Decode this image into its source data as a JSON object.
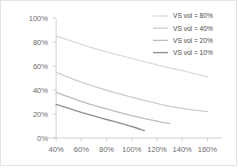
{
  "chart_data": {
    "type": "line",
    "title": "",
    "xlabel": "",
    "ylabel": "",
    "xlim": [
      30,
      170
    ],
    "ylim": [
      0,
      100
    ],
    "xticks": [
      "40%",
      "60%",
      "80%",
      "100%",
      "120%",
      "140%",
      "160%"
    ],
    "xtick_values": [
      40,
      60,
      80,
      100,
      120,
      140,
      160
    ],
    "yticks": [
      "0%",
      "20%",
      "40%",
      "60%",
      "80%",
      "100%"
    ],
    "ytick_values": [
      0,
      20,
      40,
      60,
      80,
      100
    ],
    "grid": false,
    "legend_position": "top-right",
    "series": [
      {
        "name": "VS vol = 80%",
        "color": "#dcdcdc",
        "x": [
          40,
          50,
          60,
          70,
          80,
          90,
          100,
          110,
          120,
          130,
          140,
          150,
          160
        ],
        "values": [
          85,
          81.5,
          78,
          74.8,
          71.8,
          69,
          66.3,
          63.6,
          61,
          58.5,
          56.1,
          53.6,
          51
        ]
      },
      {
        "name": "VS vol = 40%",
        "color": "#cfcfcf",
        "x": [
          40,
          50,
          60,
          70,
          80,
          90,
          100,
          110,
          120,
          130,
          140,
          150,
          160
        ],
        "values": [
          55,
          50.5,
          46.5,
          43,
          39.8,
          36.8,
          34,
          31.4,
          28.8,
          26.4,
          24.7,
          23.2,
          22
        ]
      },
      {
        "name": "VS vol = 20%",
        "color": "#bdbdbd",
        "x": [
          40,
          50,
          60,
          70,
          80,
          90,
          100,
          110,
          120,
          130
        ],
        "values": [
          38,
          34.2,
          30.6,
          27.2,
          24.2,
          21.3,
          18.6,
          16.2,
          14,
          12
        ]
      },
      {
        "name": "VS vol = 10%",
        "color": "#8f8f8f",
        "x": [
          40,
          50,
          60,
          70,
          80,
          90,
          100,
          110
        ],
        "values": [
          28,
          24.6,
          21.4,
          18.4,
          15.4,
          12.6,
          9.6,
          6.2
        ]
      }
    ]
  },
  "legend": {
    "items": [
      {
        "label": "VS vol = 80%"
      },
      {
        "label": "VS vol = 40%"
      },
      {
        "label": "VS vol = 20%"
      },
      {
        "label": "VS vol = 10%"
      }
    ]
  }
}
